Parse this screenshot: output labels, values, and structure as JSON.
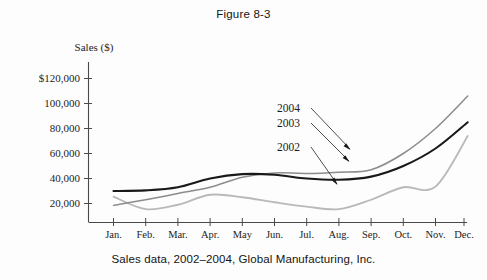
{
  "figure": {
    "title": "Figure 8-3",
    "caption": "Sales data, 2002–2004, Global Manufacturing, Inc."
  },
  "chart_data": {
    "type": "line",
    "title": "Figure 8-3",
    "subtitle": "Sales data, 2002–2004, Global Manufacturing, Inc.",
    "xlabel": "",
    "ylabel": "Sales ($)",
    "ylim": [
      0,
      130000
    ],
    "grid": false,
    "legend_position": "inline-annotations",
    "ytick_labels": [
      "$120,000",
      "100,000",
      "80,000",
      "60,000",
      "40,000",
      "20,000"
    ],
    "ytick_values": [
      120000,
      100000,
      80000,
      60000,
      40000,
      20000
    ],
    "categories": [
      "Jan.",
      "Feb.",
      "Mar.",
      "Apr.",
      "May",
      "Jun.",
      "Jul.",
      "Aug.",
      "Sep.",
      "Oct.",
      "Nov.",
      "Dec."
    ],
    "series": [
      {
        "name": "2004",
        "color": "#191919",
        "width": 2.1,
        "values": [
          30000,
          30500,
          33000,
          40000,
          43500,
          43000,
          40000,
          39000,
          41500,
          50000,
          64000,
          85000
        ]
      },
      {
        "name": "2003",
        "color": "#8c8c8c",
        "width": 1.5,
        "values": [
          18500,
          23000,
          28000,
          33000,
          41000,
          44500,
          44000,
          45000,
          47000,
          60000,
          80000,
          106000
        ]
      },
      {
        "name": "2002",
        "color": "#b9b9b9",
        "width": 1.8,
        "values": [
          25500,
          15500,
          19000,
          27000,
          25000,
          21000,
          17500,
          15500,
          23000,
          33000,
          33500,
          74000
        ]
      }
    ],
    "annotations": [
      {
        "label": "2004",
        "target_series": "2002",
        "note": "arrow points down-right to lowest line"
      },
      {
        "label": "2003",
        "target_series": "2004",
        "note": "arrow points down-right to black line"
      },
      {
        "label": "2002",
        "target_series": "2003",
        "note": "arrow points down-right to gray line"
      }
    ]
  },
  "axis": {
    "y_title": "Sales ($)",
    "ticks_y": [
      {
        "label": "$120,000"
      },
      {
        "label": "100,000"
      },
      {
        "label": "80,000"
      },
      {
        "label": "60,000"
      },
      {
        "label": "40,000"
      },
      {
        "label": "20,000"
      }
    ],
    "ticks_x": [
      {
        "label": "Jan."
      },
      {
        "label": "Feb."
      },
      {
        "label": "Mar."
      },
      {
        "label": "Apr."
      },
      {
        "label": "May"
      },
      {
        "label": "Jun."
      },
      {
        "label": "Jul."
      },
      {
        "label": "Aug."
      },
      {
        "label": "Sep."
      },
      {
        "label": "Oct."
      },
      {
        "label": "Nov."
      },
      {
        "label": "Dec."
      }
    ]
  },
  "series_labels": [
    {
      "text": "2004"
    },
    {
      "text": "2003"
    },
    {
      "text": "2002"
    }
  ]
}
